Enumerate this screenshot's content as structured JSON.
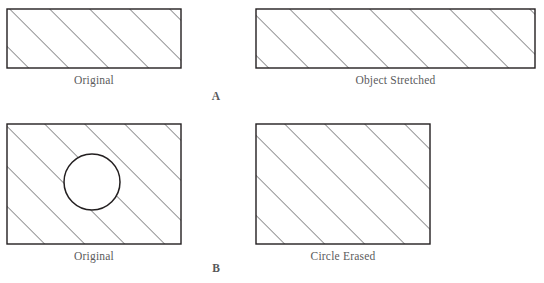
{
  "figure": {
    "width": 544,
    "height": 283,
    "background_color": "#ffffff",
    "outline_color": "#231f20",
    "hatch_color": "#3b3b3d",
    "caption_color": "#5b5b5d",
    "hatch_spacing_px": 20,
    "hatch_angle_deg": 45
  },
  "panels": [
    {
      "id": "panel-a",
      "label": "A",
      "items": [
        {
          "id": "a-original",
          "caption": "Original",
          "shape": "rectangle",
          "x": 7,
          "y": 9,
          "width": 174,
          "height": 59,
          "hatched": true,
          "circle": null
        },
        {
          "id": "a-stretched",
          "caption": "Object Stretched",
          "shape": "rectangle",
          "x": 256,
          "y": 9,
          "width": 279,
          "height": 59,
          "hatched": true,
          "circle": null
        }
      ]
    },
    {
      "id": "panel-b",
      "label": "B",
      "items": [
        {
          "id": "b-original",
          "caption": "Original",
          "shape": "rectangle",
          "x": 7,
          "y": 124,
          "width": 174,
          "height": 120,
          "hatched": true,
          "circle": {
            "cx": 92,
            "cy": 182,
            "r": 28
          }
        },
        {
          "id": "b-erased",
          "caption": "Circle Erased",
          "shape": "rectangle",
          "x": 256,
          "y": 124,
          "width": 174,
          "height": 120,
          "hatched": true,
          "circle": null
        }
      ]
    }
  ],
  "captions": {
    "a_left": "Original",
    "a_right": "Object Stretched",
    "a_section": "A",
    "b_left": "Original",
    "b_right": "Circle Erased",
    "b_section": "B"
  }
}
